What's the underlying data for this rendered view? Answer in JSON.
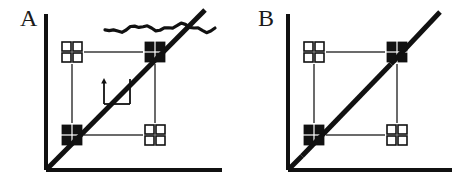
{
  "figure": {
    "type": "schematic-diagram",
    "background_color": "#ffffff",
    "ink_color": "#111111",
    "thin_line_color": "#3a3a3a",
    "width": 462,
    "height": 184,
    "panels": [
      {
        "id": "A",
        "label": "A",
        "label_x": 20,
        "label_y": 26,
        "axes": {
          "name": "L-shaped-axes",
          "stroke_width": 4,
          "origin_x": 46,
          "origin_y": 170,
          "y_axis_top_y": 14,
          "x_axis_right_x": 222,
          "x_label": "",
          "y_label": ""
        },
        "diagonal": {
          "name": "identity-diagonal",
          "stroke_width": 5,
          "x1": 46,
          "y1": 170,
          "x2": 205,
          "y2": 10,
          "gap": false
        },
        "squiggle": {
          "present": true,
          "name": "hand-drawn-squiggle",
          "x1": 105,
          "y1": 28,
          "x2": 215,
          "y2": 28
        },
        "annotation": {
          "present": true,
          "name": "slope-bracket-annotation",
          "arrow_x": 104,
          "arrow_y_top": 82,
          "arrow_y_bottom": 104,
          "bracket_x2": 130,
          "bracket_y2": 104,
          "corner_x": 130,
          "corner_y": 79
        },
        "glyphs": [
          {
            "name": "glyph-top-left",
            "kind": "open",
            "cx": 72,
            "cy": 52
          },
          {
            "name": "glyph-top-right",
            "kind": "filled",
            "cx": 155,
            "cy": 52
          },
          {
            "name": "glyph-bottom-left",
            "kind": "filled",
            "cx": 72,
            "cy": 135
          },
          {
            "name": "glyph-bottom-right",
            "kind": "open",
            "cx": 155,
            "cy": 135
          }
        ],
        "connectors": [
          {
            "name": "connector-top",
            "x1": 84,
            "y1": 52,
            "x2": 143,
            "y2": 52
          },
          {
            "name": "connector-bottom",
            "x1": 84,
            "y1": 135,
            "x2": 143,
            "y2": 135
          },
          {
            "name": "connector-left",
            "x1": 72,
            "y1": 64,
            "x2": 72,
            "y2": 123
          },
          {
            "name": "connector-right",
            "x1": 155,
            "y1": 64,
            "x2": 155,
            "y2": 123
          }
        ]
      },
      {
        "id": "B",
        "label": "B",
        "label_x": 258,
        "label_y": 26,
        "axes": {
          "name": "L-shaped-axes",
          "stroke_width": 4,
          "origin_x": 288,
          "origin_y": 170,
          "y_axis_top_y": 14,
          "x_axis_right_x": 452,
          "x_label": "",
          "y_label": ""
        },
        "diagonal": {
          "name": "identity-diagonal",
          "stroke_width": 5,
          "x1": 288,
          "y1": 170,
          "x2": 440,
          "y2": 12,
          "gap": true,
          "gap_start_x": 302,
          "gap_start_y": 156,
          "gap_end_x": 391,
          "gap_end_y": 64
        },
        "squiggle": {
          "present": false
        },
        "annotation": {
          "present": false
        },
        "glyphs": [
          {
            "name": "glyph-top-left",
            "kind": "open",
            "cx": 314,
            "cy": 52
          },
          {
            "name": "glyph-top-right",
            "kind": "filled",
            "cx": 397,
            "cy": 52
          },
          {
            "name": "glyph-bottom-left",
            "kind": "filled",
            "cx": 314,
            "cy": 135
          },
          {
            "name": "glyph-bottom-right",
            "kind": "open",
            "cx": 397,
            "cy": 135
          }
        ],
        "connectors": [
          {
            "name": "connector-top",
            "x1": 326,
            "y1": 52,
            "x2": 385,
            "y2": 52
          },
          {
            "name": "connector-bottom",
            "x1": 326,
            "y1": 135,
            "x2": 385,
            "y2": 135
          },
          {
            "name": "connector-left",
            "x1": 314,
            "y1": 64,
            "x2": 314,
            "y2": 123
          },
          {
            "name": "connector-right",
            "x1": 397,
            "y1": 64,
            "x2": 397,
            "y2": 123
          }
        ]
      }
    ],
    "glyph_spec": {
      "description": "2x2 grid of small squares; filled = solid black, open = white fill with black outline",
      "cell": 9,
      "gap": 2,
      "outline_width": 1.6
    }
  }
}
